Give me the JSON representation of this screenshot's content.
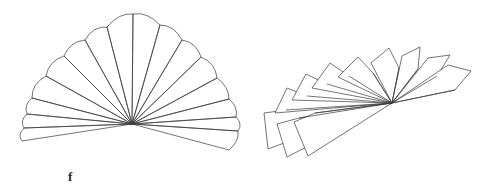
{
  "figure": {
    "caption": "f",
    "caption_position": {
      "x": 68,
      "y": 170
    },
    "background_color": "#ffffff",
    "stroke_color": "#3a3a3a",
    "stroke_width": 0.7,
    "fill": "none",
    "width": 498,
    "height": 191,
    "panels": [
      {
        "name": "left-fan-diagram",
        "description": "wide scalloped fan of 16 petals radiating from a common hub",
        "hub": {
          "x": 132,
          "y": 124
        },
        "petal_count": 16,
        "petals": [
          {
            "index": 0,
            "points": "132,124 22,141 24,128 129,121"
          },
          {
            "index": 1,
            "points": "132,124 24,128 27,114 129,121"
          },
          {
            "index": 2,
            "points": "132,124 27,114 32,98 129,121"
          },
          {
            "index": 3,
            "points": "132,124 32,98 46,76 129,121"
          },
          {
            "index": 4,
            "points": "132,124 46,76 64,56 130,120"
          },
          {
            "index": 5,
            "points": "132,124 64,56 85,40 130,120"
          },
          {
            "index": 6,
            "points": "132,124 85,40 107,27 131,120"
          },
          {
            "index": 7,
            "points": "132,124 107,27 133,14 132,119"
          },
          {
            "index": 8,
            "points": "133,124 133,14 160,25 134,119"
          },
          {
            "index": 9,
            "points": "133,124 160,25 182,40 135,120"
          },
          {
            "index": 10,
            "points": "133,124 182,40 201,57 135,120"
          },
          {
            "index": 11,
            "points": "133,124 201,57 217,78 136,121"
          },
          {
            "index": 12,
            "points": "133,124 217,78 229,99 136,121"
          },
          {
            "index": 13,
            "points": "133,124 229,99 236,117 136,122"
          },
          {
            "index": 14,
            "points": "133,124 236,117 238,131 135,122"
          },
          {
            "index": 15,
            "points": "133,124 238,131 229,150 134,122"
          }
        ],
        "scallop_arcs": [
          {
            "from": "22,141",
            "to": "24,128",
            "bulge": 3
          },
          {
            "from": "24,128",
            "to": "27,114",
            "bulge": 3
          },
          {
            "from": "27,114",
            "to": "32,98",
            "bulge": 3
          },
          {
            "from": "32,98",
            "to": "46,76",
            "bulge": 4
          },
          {
            "from": "46,76",
            "to": "64,56",
            "bulge": 4
          },
          {
            "from": "64,56",
            "to": "85,40",
            "bulge": 4
          },
          {
            "from": "85,40",
            "to": "107,27",
            "bulge": 4
          },
          {
            "from": "107,27",
            "to": "133,14",
            "bulge": 4
          },
          {
            "from": "133,14",
            "to": "160,25",
            "bulge": 4
          },
          {
            "from": "160,25",
            "to": "182,40",
            "bulge": 4
          },
          {
            "from": "182,40",
            "to": "201,57",
            "bulge": 4
          },
          {
            "from": "201,57",
            "to": "217,78",
            "bulge": 4
          },
          {
            "from": "217,78",
            "to": "229,99",
            "bulge": 3
          },
          {
            "from": "229,99",
            "to": "236,117",
            "bulge": 3
          },
          {
            "from": "236,117",
            "to": "238,131",
            "bulge": 3
          },
          {
            "from": "238,131",
            "to": "229,150",
            "bulge": 3
          }
        ]
      },
      {
        "name": "right-fan-diagram",
        "description": "narrower fan of 11 overlapping quadrilateral blades radiating from a common hub",
        "hub": {
          "x": 392,
          "y": 103
        },
        "petal_count": 11,
        "petals": [
          {
            "index": 0,
            "points": "392,103 268,149 264,113 286,110"
          },
          {
            "index": 1,
            "points": "392,103 287,157 277,124 299,118"
          },
          {
            "index": 2,
            "points": "392,103 308,156 294,122 315,113"
          },
          {
            "index": 3,
            "points": "392,103 275,113 287,88 307,96"
          },
          {
            "index": 4,
            "points": "392,103 292,100 306,74 327,84"
          },
          {
            "index": 5,
            "points": "392,103 312,88 330,63 349,76"
          },
          {
            "index": 6,
            "points": "392,103 338,77 358,57 373,73"
          },
          {
            "index": 7,
            "points": "392,103 371,63 389,48 399,68"
          },
          {
            "index": 8,
            "points": "392,103 402,56 420,47 418,69"
          },
          {
            "index": 9,
            "points": "392,103 428,58 450,55 437,76"
          },
          {
            "index": 10,
            "points": "392,103 448,65 471,71 455,90"
          }
        ],
        "spokes": [
          "392,103 286,110",
          "392,103 299,118",
          "392,103 315,113",
          "392,103 307,96",
          "392,103 327,84",
          "392,103 349,76",
          "392,103 373,73",
          "392,103 399,68",
          "392,103 418,69",
          "392,103 437,76",
          "392,103 455,90"
        ]
      }
    ]
  }
}
